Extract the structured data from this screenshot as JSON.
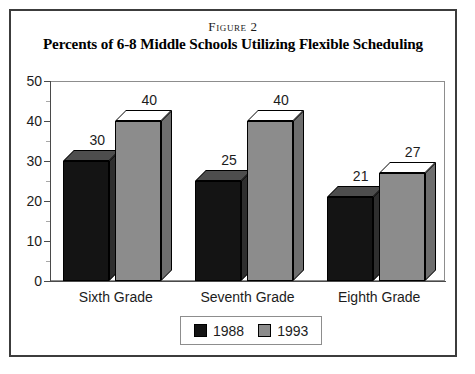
{
  "figure": {
    "number_label": "Figure 2",
    "title": "Percents of 6-8 Middle Schools Utilizing Flexible Scheduling"
  },
  "chart_data": {
    "type": "bar",
    "title": "Percents of 6-8 Middle Schools Utilizing Flexible Scheduling",
    "xlabel": "",
    "ylabel": "",
    "ylim": [
      0,
      50
    ],
    "yticks": [
      0,
      10,
      20,
      30,
      40,
      50
    ],
    "ytick_labels": [
      "0",
      "10",
      "20",
      "30",
      "40",
      "50"
    ],
    "grid": false,
    "legend_position": "bottom-center",
    "categories": [
      "Sixth Grade",
      "Seventh Grade",
      "Eighth Grade"
    ],
    "series": [
      {
        "name": "1988",
        "color": "#141414",
        "values": [
          30,
          25,
          21
        ],
        "labels": [
          "30",
          "25",
          "21"
        ]
      },
      {
        "name": "1993",
        "color": "#8c8c8c",
        "values": [
          40,
          40,
          27
        ],
        "labels": [
          "40",
          "40",
          "27"
        ]
      }
    ]
  },
  "legend": {
    "entries": [
      {
        "label": "1988",
        "color": "#141414"
      },
      {
        "label": "1993",
        "color": "#8c8c8c"
      }
    ]
  },
  "colors": {
    "border": "#3c3c3c",
    "axis": "#4a4a4a",
    "plot_frame": "#8d8d8d",
    "series_1988": "#141414",
    "series_1993": "#8c8c8c",
    "text": "#1c1c1c"
  }
}
